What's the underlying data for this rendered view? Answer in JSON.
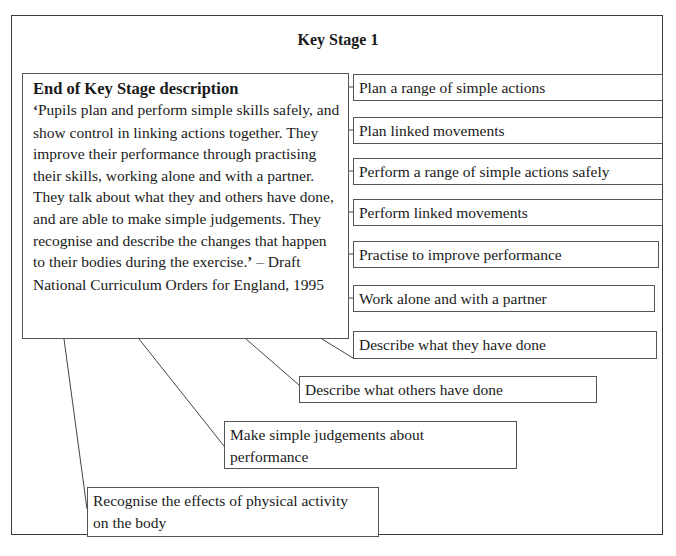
{
  "diagram": {
    "title": "Key Stage 1",
    "description": {
      "heading": "End of Key Stage description",
      "open_quote": "‘",
      "quote": "Pupils plan and perform simple skills safely, and show control in linking actions together. They improve their performance through practising their skills, working alone and with a partner. They talk about what they and others have done, and are able to make simple judgements. They recognise and describe the changes that happen to their bodies during the exercise.",
      "close_quote": "’",
      "attribution": " – Draft National Curriculum Orders for England, 1995"
    },
    "skills": [
      {
        "label": "Plan a range of simple actions"
      },
      {
        "label": "Plan linked movements"
      },
      {
        "label": "Perform a range of simple actions safely"
      },
      {
        "label": "Perform linked movements"
      },
      {
        "label": "Practise to improve performance"
      },
      {
        "label": "Work alone and with a partner"
      },
      {
        "label": "Describe what they have done"
      },
      {
        "label": "Describe what others have done"
      },
      {
        "label": "Make simple judgements about performance"
      },
      {
        "label": "Recognise the effects of physical activity on the body"
      }
    ]
  }
}
